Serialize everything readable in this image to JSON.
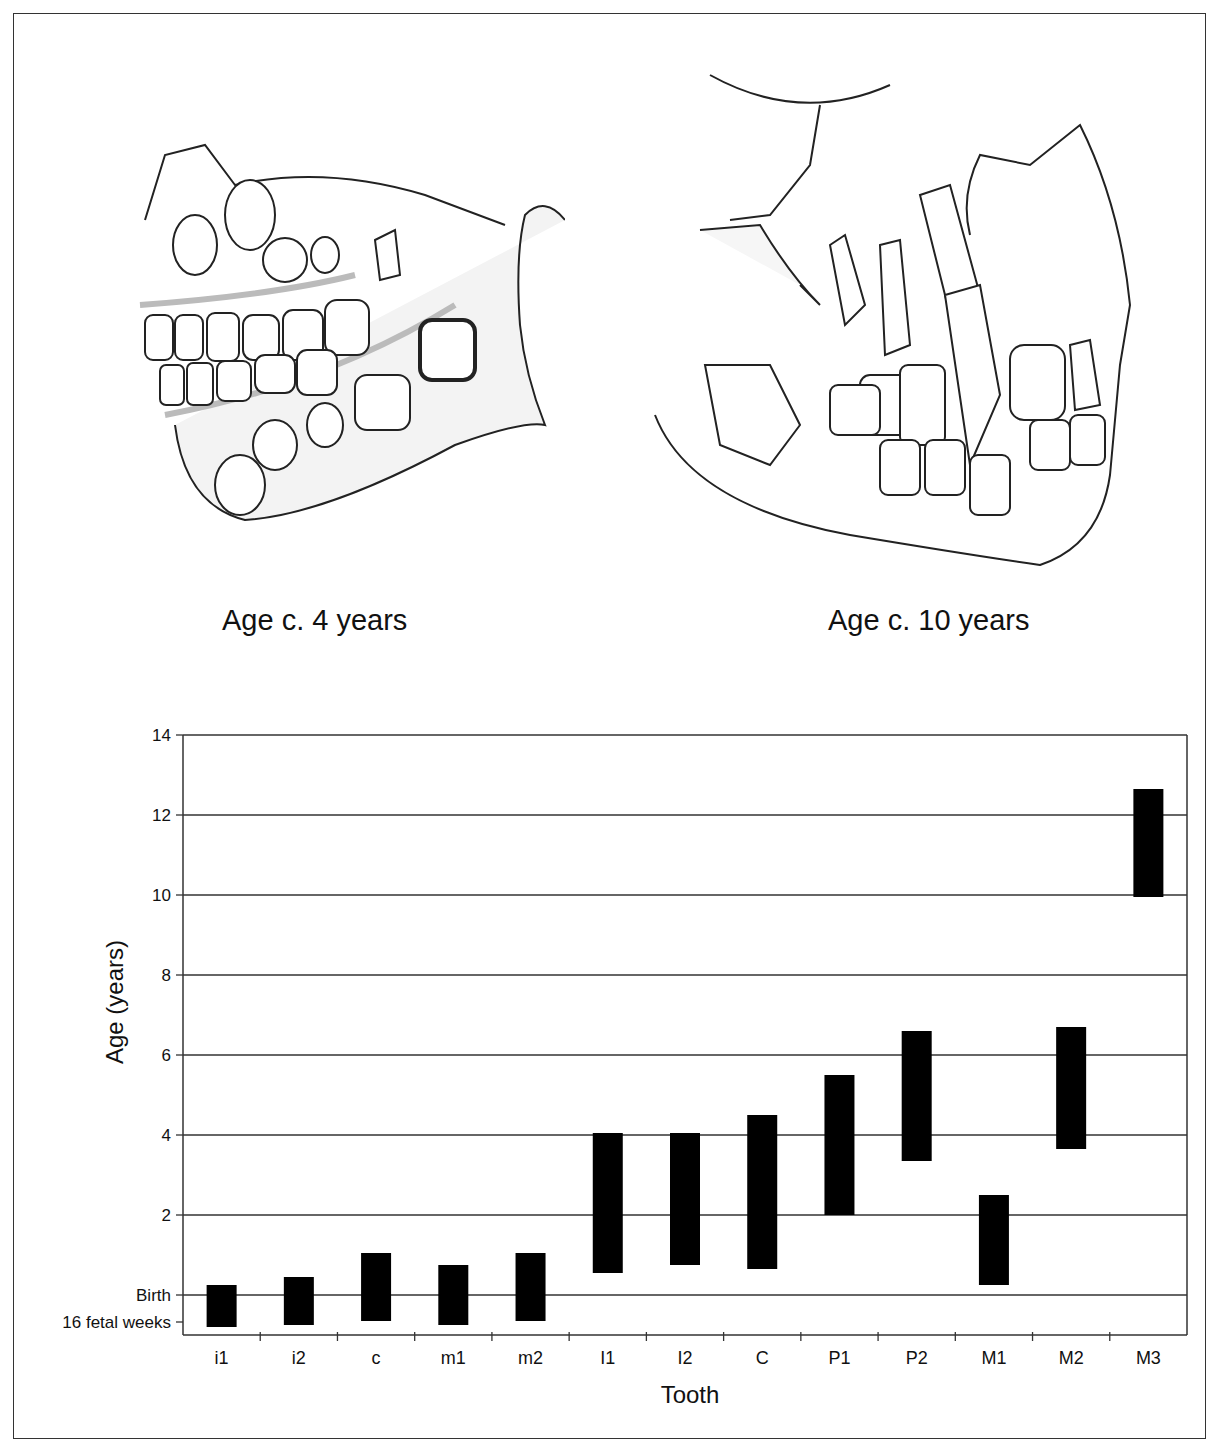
{
  "figure": {
    "illustrations": [
      {
        "caption": "Age c. 4 years",
        "subject": "child-skull-jaw-4-years"
      },
      {
        "caption": "Age c. 10 years",
        "subject": "child-skull-jaw-10-years"
      }
    ]
  },
  "chart_data": {
    "type": "bar",
    "subtype": "floating-range",
    "title": "",
    "xlabel": "Tooth",
    "ylabel": "Age (years)",
    "ylim": [
      -0.7,
      14
    ],
    "yticks": [
      {
        "value": 14,
        "label": "14"
      },
      {
        "value": 12,
        "label": "12"
      },
      {
        "value": 10,
        "label": "10"
      },
      {
        "value": 8,
        "label": "8"
      },
      {
        "value": 6,
        "label": "6"
      },
      {
        "value": 4,
        "label": "4"
      },
      {
        "value": 2,
        "label": "2"
      },
      {
        "value": 0,
        "label": "Birth"
      },
      {
        "value": -0.675,
        "label": "16 fetal weeks"
      }
    ],
    "grid": true,
    "legend": null,
    "categories": [
      "i1",
      "i2",
      "c",
      "m1",
      "m2",
      "I1",
      "I2",
      "C",
      "P1",
      "P2",
      "M1",
      "M2",
      "M3"
    ],
    "series": [
      {
        "name": "start",
        "values": [
          -0.8,
          -0.75,
          -0.65,
          -0.75,
          -0.65,
          0.55,
          0.75,
          0.65,
          2.0,
          3.35,
          0.25,
          3.65,
          9.95
        ]
      },
      {
        "name": "end",
        "values": [
          0.25,
          0.45,
          1.05,
          0.75,
          1.05,
          4.05,
          4.05,
          4.5,
          5.5,
          6.6,
          2.5,
          6.7,
          12.65
        ]
      }
    ],
    "bar_color": "#000000",
    "grid_color": "#333333"
  }
}
